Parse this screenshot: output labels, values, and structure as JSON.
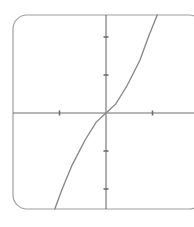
{
  "chart_data": {
    "type": "line",
    "title": "",
    "xlabel": "",
    "ylabel": "",
    "grid": false,
    "legend": null,
    "x_ticks": [
      -1,
      1
    ],
    "y_ticks": [
      -2,
      -1,
      1,
      2
    ],
    "xlim": [
      -1.1,
      1.8
    ],
    "ylim": [
      -2.5,
      2.6
    ],
    "series": [
      {
        "name": "curve",
        "x": [
          -1.1,
          -0.95,
          -0.73,
          -0.45,
          -0.21,
          0,
          0.21,
          0.45,
          0.73,
          0.92,
          1.1
        ],
        "y": [
          -2.53,
          -2.03,
          -1.37,
          -0.71,
          -0.24,
          0,
          0.24,
          0.71,
          1.39,
          2.03,
          2.58
        ]
      }
    ],
    "colors": {
      "frame": "#a0a0a0",
      "axes": "#6e6e6e",
      "curve": "#8a8a8a"
    }
  },
  "layout": {
    "origin_px": [
      106,
      113
    ],
    "x_unit_px": 46.5,
    "y_unit_px": 38,
    "frame": {
      "x": 13,
      "y": 15,
      "width": 190,
      "height": 194,
      "radius": 14
    }
  }
}
